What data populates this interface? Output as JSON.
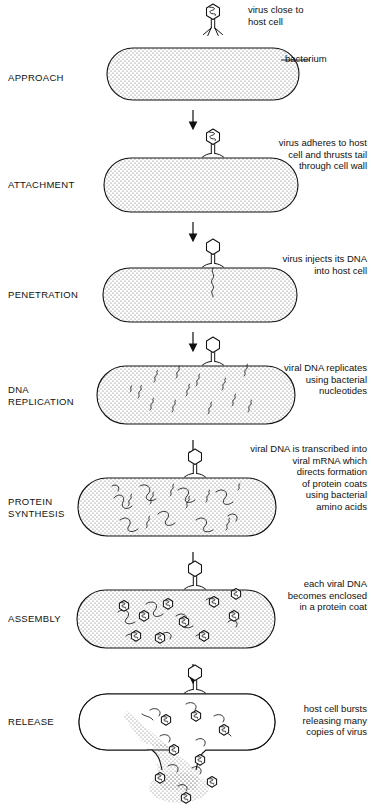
{
  "figure": {
    "bacterium_label": "bacterium"
  },
  "stages": [
    {
      "id": "approach",
      "label": "APPROACH",
      "annotation": "virus close to\nhost cell",
      "annotation_align": "left",
      "cell_fill": "stipple",
      "phage_position": "above-cell",
      "contents": "empty"
    },
    {
      "id": "attachment",
      "label": "ATTACHMENT",
      "annotation": "virus adheres to host\ncell and thrusts tail\nthrough cell wall",
      "annotation_align": "right",
      "cell_fill": "stipple",
      "phage_position": "on-cell-surface",
      "contents": "empty"
    },
    {
      "id": "penetration",
      "label": "PENETRATION",
      "annotation": "virus injects its DNA\ninto host cell",
      "annotation_align": "right",
      "cell_fill": "stipple",
      "phage_position": "tail-inserted",
      "contents": "one-dna-strand"
    },
    {
      "id": "dna-replication",
      "label": "DNA\nREPLICATION",
      "annotation": "viral DNA replicates\nusing bacterial\nnucleotides",
      "annotation_align": "right",
      "cell_fill": "stipple",
      "phage_position": "tail-inserted",
      "contents": "many-dna-strands"
    },
    {
      "id": "protein-synthesis",
      "label": "PROTEIN\nSYNTHESIS",
      "annotation": "viral DNA is transcribed into\nviral mRNA which\ndirects formation\nof protein coats\nusing bacterial\namino acids",
      "annotation_align": "right",
      "cell_fill": "stipple",
      "phage_position": "tail-inserted",
      "contents": "dna-and-protein-coats"
    },
    {
      "id": "assembly",
      "label": "ASSEMBLY",
      "annotation": "each viral DNA\nbecomes enclosed\nin a protein coat",
      "annotation_align": "right",
      "cell_fill": "stipple",
      "phage_position": "tail-inserted",
      "contents": "assembled-virions"
    },
    {
      "id": "release",
      "label": "RELEASE",
      "annotation": "host cell bursts\nreleasing many\ncopies of virus",
      "annotation_align": "right",
      "cell_fill": "clear",
      "phage_position": "tail-inserted",
      "contents": "bursting-virions"
    }
  ],
  "colors": {
    "ink": "#111111",
    "page": "#ffffff",
    "stipple": "#6b6b6b"
  }
}
